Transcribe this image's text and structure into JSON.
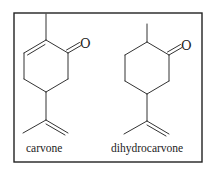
{
  "figure": {
    "frame_color": "#222222",
    "molecules": [
      {
        "name": "carvone",
        "caption": "carvone",
        "atom_labels": {
          "oxygen": "O"
        },
        "features": [
          "methyl",
          "ring C=C double bond",
          "ketone C=O",
          "isopropenyl group"
        ]
      },
      {
        "name": "dihydrocarvone",
        "caption": "dihydrocarvone",
        "atom_labels": {
          "oxygen": "O"
        },
        "features": [
          "methyl",
          "saturated ring",
          "ketone C=O",
          "isopropenyl group"
        ]
      }
    ]
  }
}
